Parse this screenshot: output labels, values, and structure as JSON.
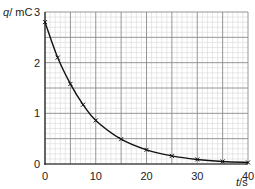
{
  "chart_data": {
    "type": "line",
    "title": "",
    "xlabel": "t/s",
    "ylabel": "q/mC",
    "xlabel_var": "t",
    "xlabel_unit": "s",
    "ylabel_var": "q",
    "ylabel_unit": "mC",
    "xlim": [
      0,
      40
    ],
    "ylim": [
      0,
      3
    ],
    "x_ticks": [
      0,
      10,
      20,
      30,
      40
    ],
    "y_ticks": [
      0,
      1,
      2,
      3
    ],
    "grid": true,
    "grid_major_x": 5,
    "grid_minor_x": 1,
    "grid_major_y": 0.5,
    "grid_minor_y": 0.1,
    "marker": "x",
    "curve": "smooth exponential decay through points",
    "series": [
      {
        "name": "charge",
        "x": [
          0,
          2.5,
          5,
          7.5,
          10,
          15,
          20,
          25,
          30,
          35,
          40
        ],
        "y": [
          2.8,
          2.1,
          1.58,
          1.17,
          0.86,
          0.49,
          0.28,
          0.16,
          0.09,
          0.05,
          0.03
        ]
      }
    ]
  },
  "labels": {
    "y_axis": "q/ mC",
    "x_axis": "t/s",
    "x_tick_labels": [
      "0",
      "10",
      "20",
      "30",
      "40"
    ],
    "y_tick_labels": [
      "0",
      "1",
      "2",
      "3"
    ]
  },
  "colors": {
    "minor_grid": "#d6d6d6",
    "major_grid": "#8a8a8a",
    "curve": "#111111",
    "text": "#222222"
  }
}
